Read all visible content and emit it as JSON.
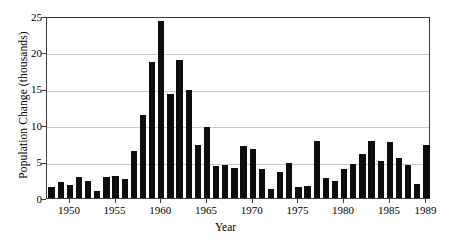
{
  "chart_data": {
    "type": "bar",
    "title": "",
    "xlabel": "Year",
    "ylabel": "Population Change (thousands)",
    "xlim": [
      1947.5,
      1989.5
    ],
    "ylim": [
      0,
      25
    ],
    "grid": true,
    "legend": false,
    "bar_color": "#0d0d0d",
    "grid_color": "#c9c9c9",
    "axis_color": "#3a3a3a",
    "ytick_values": [
      0,
      5,
      10,
      15,
      20,
      25
    ],
    "ytick_labels": [
      "0",
      "5",
      "10",
      "15",
      "20",
      "25"
    ],
    "xtick_values": [
      1950,
      1955,
      1960,
      1965,
      1970,
      1975,
      1980,
      1985,
      1989
    ],
    "xtick_labels": [
      "1950",
      "1955",
      "1960",
      "1965",
      "1970",
      "1975",
      "1980",
      "1985",
      "1989"
    ],
    "categories": [
      1948,
      1949,
      1950,
      1951,
      1952,
      1953,
      1954,
      1955,
      1956,
      1957,
      1958,
      1959,
      1960,
      1961,
      1962,
      1963,
      1964,
      1965,
      1966,
      1967,
      1968,
      1969,
      1970,
      1971,
      1972,
      1973,
      1974,
      1975,
      1976,
      1977,
      1978,
      1979,
      1980,
      1981,
      1982,
      1983,
      1984,
      1985,
      1986,
      1987,
      1988,
      1989
    ],
    "values": [
      1.5,
      2.2,
      1.8,
      2.9,
      2.4,
      0.9,
      2.9,
      3.0,
      2.6,
      6.5,
      11.4,
      18.7,
      24.3,
      14.3,
      19.0,
      14.8,
      7.3,
      9.8,
      4.4,
      4.6,
      4.1,
      7.2,
      6.7,
      4.0,
      1.3,
      3.6,
      4.8,
      1.5,
      1.7,
      7.8,
      2.7,
      2.4,
      4.0,
      4.7,
      6.0,
      7.9,
      5.1,
      7.7,
      5.5,
      4.6,
      1.9,
      7.3
    ]
  }
}
